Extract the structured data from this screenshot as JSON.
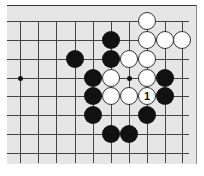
{
  "board": {
    "cols_x": [
      20,
      38,
      56,
      75,
      93,
      111,
      129,
      147,
      165,
      182
    ],
    "rows_y": [
      21,
      40,
      59,
      78,
      96,
      115,
      134,
      153
    ],
    "star_points": [
      [
        0,
        3
      ],
      [
        6,
        3
      ]
    ],
    "stones": [
      {
        "color": "white",
        "col": 7,
        "row": 0,
        "label": ""
      },
      {
        "color": "white",
        "col": 7,
        "row": 1,
        "label": ""
      },
      {
        "color": "white",
        "col": 8,
        "row": 1,
        "label": ""
      },
      {
        "color": "white",
        "col": 9,
        "row": 1,
        "label": ""
      },
      {
        "color": "black",
        "col": 5,
        "row": 1,
        "label": ""
      },
      {
        "color": "black",
        "col": 3,
        "row": 2,
        "label": ""
      },
      {
        "color": "black",
        "col": 5,
        "row": 2,
        "label": ""
      },
      {
        "color": "white",
        "col": 6,
        "row": 2,
        "label": ""
      },
      {
        "color": "white",
        "col": 7,
        "row": 2,
        "label": ""
      },
      {
        "color": "black",
        "col": 4,
        "row": 3,
        "label": ""
      },
      {
        "color": "white",
        "col": 5,
        "row": 3,
        "label": ""
      },
      {
        "color": "white",
        "col": 7,
        "row": 3,
        "label": ""
      },
      {
        "color": "black",
        "col": 8,
        "row": 3,
        "label": ""
      },
      {
        "color": "black",
        "col": 4,
        "row": 4,
        "label": ""
      },
      {
        "color": "white",
        "col": 5,
        "row": 4,
        "label": ""
      },
      {
        "color": "white",
        "col": 6,
        "row": 4,
        "label": ""
      },
      {
        "color": "white",
        "col": 7,
        "row": 4,
        "label": "1"
      },
      {
        "color": "black",
        "col": 8,
        "row": 4,
        "label": ""
      },
      {
        "color": "black",
        "col": 4,
        "row": 5,
        "label": ""
      },
      {
        "color": "black",
        "col": 7,
        "row": 5,
        "label": ""
      },
      {
        "color": "black",
        "col": 5,
        "row": 6,
        "label": ""
      },
      {
        "color": "black",
        "col": 6,
        "row": 6,
        "label": ""
      }
    ]
  }
}
